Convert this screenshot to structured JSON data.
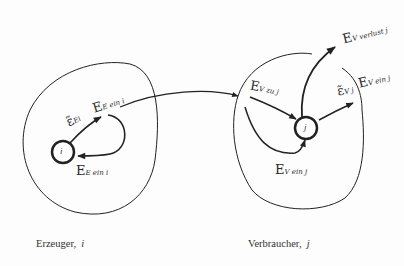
{
  "diagram": {
    "left_region": {
      "caption": "Erzeuger,",
      "caption_var": "i",
      "node_label": "i",
      "labels": {
        "upper_eps": "ε̃",
        "upper_eps_sub": "Ei",
        "upper_E": "E",
        "upper_E_sub": "E ein i",
        "lower_E": "E",
        "lower_E_sub": "E ein i"
      }
    },
    "right_region": {
      "caption": "Verbraucher,",
      "caption_var": "j",
      "node_label": "j",
      "labels": {
        "in_E": "E",
        "in_E_sub": "V zu j",
        "loss_E": "E",
        "loss_E_sub": "V verlust j",
        "out_eps": "ε̃",
        "out_eps_sub": "V j",
        "out_E": "E",
        "out_E_sub": "V ein j",
        "bottom_E": "E",
        "bottom_E_sub": "V ein j"
      }
    },
    "colors": {
      "stroke": "#222222",
      "background": "#fdfdfd"
    }
  }
}
